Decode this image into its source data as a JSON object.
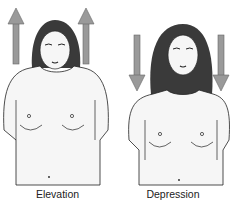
{
  "figure": {
    "panels": [
      {
        "label": "Elevation",
        "arrow_direction": "up",
        "arrow_color": "#9a9a9a",
        "arrow_outline": "#555555"
      },
      {
        "label": "Depression",
        "arrow_direction": "down",
        "arrow_color": "#9a9a9a",
        "arrow_outline": "#555555"
      }
    ],
    "colors": {
      "skin": "#f4f4f4",
      "hair": "#3a3a3a",
      "line": "#222222",
      "background": "#ffffff"
    }
  }
}
